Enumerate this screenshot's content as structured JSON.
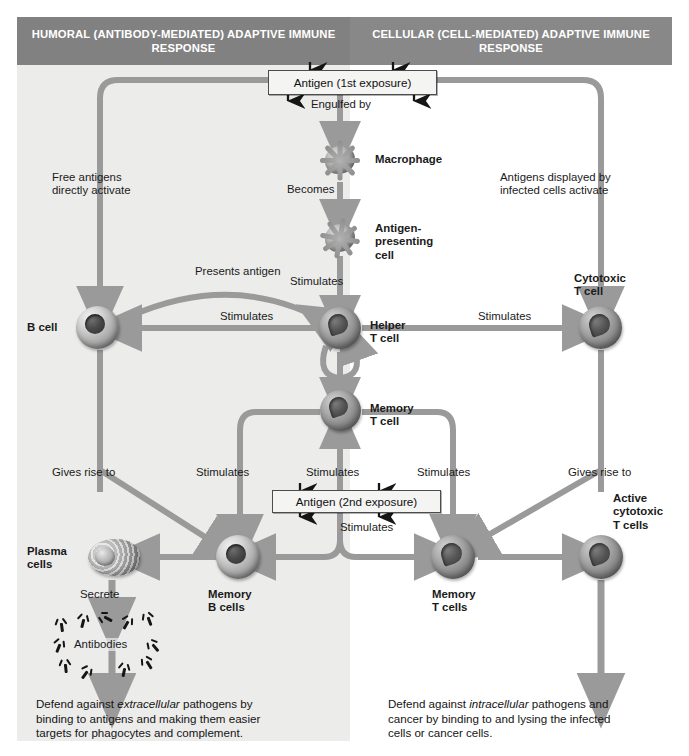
{
  "headers": {
    "left": "HUMORAL (ANTIBODY-MEDIATED) ADAPTIVE\nIMMUNE RESPONSE",
    "right": "CELLULAR (CELL-MEDIATED) ADAPTIVE\nIMMUNE RESPONSE"
  },
  "boxes": {
    "antigen_first": "Antigen (1st exposure)",
    "antigen_second": "Antigen (2nd exposure)"
  },
  "cells": {
    "macrophage": "Macrophage",
    "apc": "Antigen-\npresenting\ncell",
    "b_cell": "B cell",
    "helper_t": "Helper\nT cell",
    "cytotoxic_t": "Cytotoxic\nT cell",
    "memory_t_mid": "Memory\nT cell",
    "plasma": "Plasma\ncells",
    "memory_b": "Memory\nB cells",
    "memory_t": "Memory\nT cells",
    "active_cytotoxic": "Active\ncytotoxic\nT cells",
    "antibodies": "Antibodies"
  },
  "arrow_labels": {
    "engulfed_by": "Engulfed by",
    "becomes": "Becomes",
    "free_antigens": "Free antigens\ndirectly activate",
    "antigens_displayed": "Antigens displayed by\ninfected cells activate",
    "presents_antigen": "Presents antigen",
    "stimulates_apc": "Stimulates",
    "stimulates_b": "Stimulates",
    "stimulates_cyto": "Stimulates",
    "gives_rise_left": "Gives rise to",
    "gives_rise_right": "Gives rise to",
    "stimulates_mem_b": "Stimulates",
    "stimulates_up": "Stimulates",
    "stimulates_mem_t": "Stimulates",
    "stimulates_down": "Stimulates",
    "secrete": "Secrete"
  },
  "captions": {
    "left_pre": "Defend against ",
    "left_em": "extracellular",
    "left_post": " pathogens by\nbinding to antigens and making them easier\ntargets for phagocytes and complement.",
    "right_pre": "Defend against ",
    "right_em": "intracellular",
    "right_post": " pathogens and\ncancer by binding to and lysing the infected\ncells or cancer cells."
  },
  "colors": {
    "header_bg": "#818181",
    "panel_left_bg": "#ececeb",
    "panel_right_bg": "#ffffff",
    "arrow": "#9a9a9a",
    "box_bg": "#f4f4f2",
    "text": "#1a1a1a"
  }
}
